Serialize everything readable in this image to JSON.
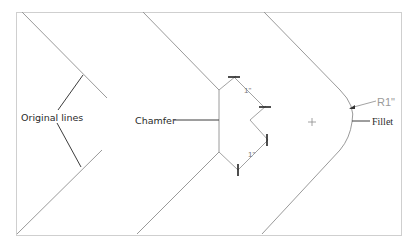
{
  "diagram": {
    "panels": [
      {
        "id": "original",
        "label": "Original lines"
      },
      {
        "id": "chamfer",
        "label": "Chamfer",
        "dimensions": [
          "1\"",
          "1\""
        ]
      },
      {
        "id": "fillet",
        "label": "Fillet",
        "radius_label": "R1\""
      }
    ],
    "colors": {
      "geometry": "#9a9a9a",
      "leader": "#3c3c3c",
      "frame": "#cfcfcf",
      "dim_text": "#7a7a7a"
    }
  }
}
